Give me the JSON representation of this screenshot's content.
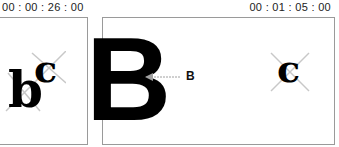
{
  "timecodes": {
    "left": "00 : 00 : 26 : 00",
    "right": "00 : 01 : 05 : 00"
  },
  "frames": {
    "left": {
      "glyphs": [
        "b",
        "c"
      ]
    },
    "right": {
      "glyphs": [
        "c"
      ]
    }
  },
  "overlay": {
    "big_letter": "B",
    "callout_label": "B"
  },
  "colors": {
    "frame_border": "#9a9a9a",
    "cross": "#c8c8c8",
    "arrow": "#a0a0a0"
  }
}
